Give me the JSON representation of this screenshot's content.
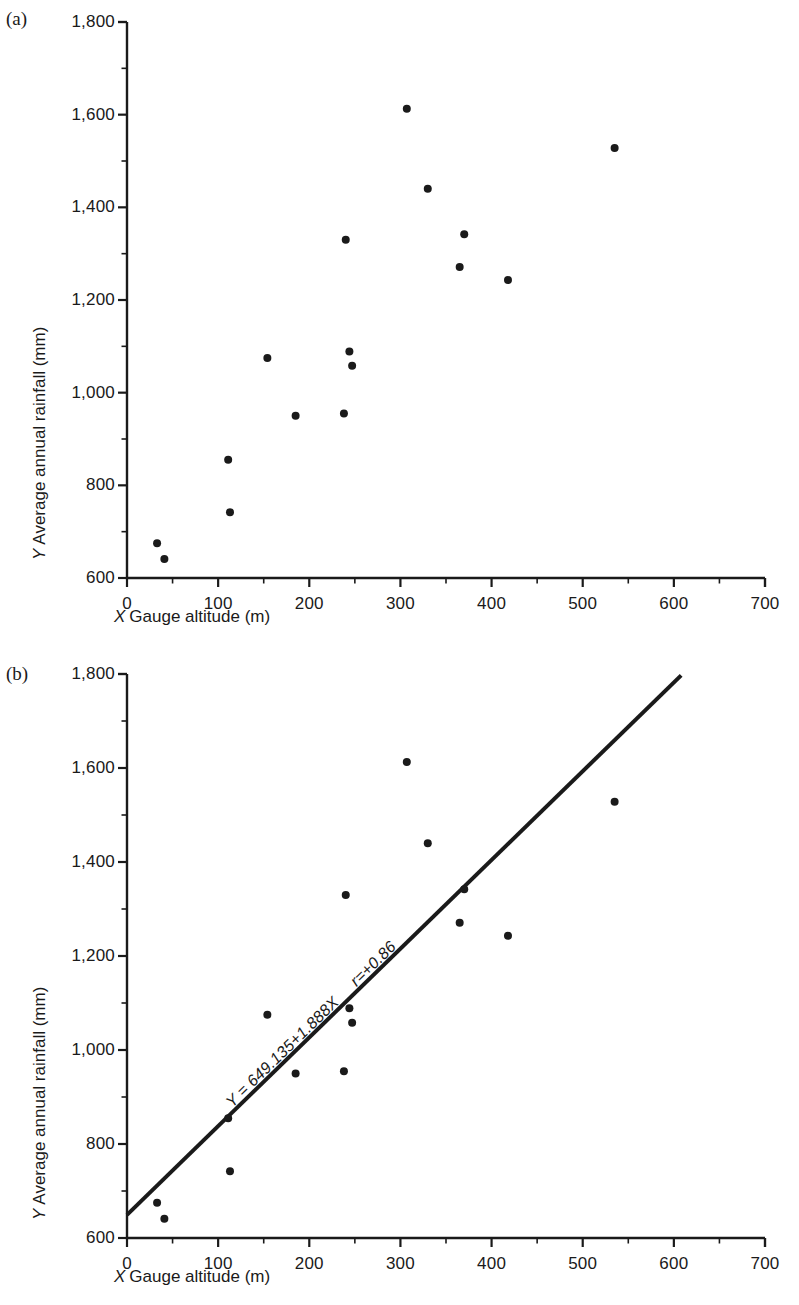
{
  "figure": {
    "panels": [
      {
        "label": "(a)",
        "name": "scatter-plot-without-regression"
      },
      {
        "label": "(b)",
        "name": "scatter-plot-with-regression"
      }
    ]
  },
  "axes": {
    "x_title_var": "X",
    "x_title_text": "Gauge altitude (m)",
    "y_title_var": "Y",
    "y_title_text": "Average annual rainfall (mm)",
    "x_ticks": [
      "0",
      "100",
      "200",
      "300",
      "400",
      "500",
      "600",
      "700"
    ],
    "y_ticks": [
      "600",
      "800",
      "1,000",
      "1,200",
      "1,400",
      "1,600",
      "1,800"
    ]
  },
  "annotation": {
    "equation": "Y = 649.135+1.888X",
    "correlation": "r=+0.86"
  },
  "chart_data": {
    "type": "scatter",
    "title": "",
    "xlabel": "X Gauge altitude (m)",
    "ylabel": "Y Average annual rainfall (mm)",
    "xlim": [
      0,
      700
    ],
    "ylim": [
      600,
      1800
    ],
    "x_tick_values": [
      0,
      100,
      200,
      300,
      400,
      500,
      600,
      700
    ],
    "y_tick_values": [
      600,
      800,
      1000,
      1200,
      1400,
      1600,
      1800
    ],
    "x_minor_tick_step": 50,
    "y_minor_tick_step": 100,
    "grid": false,
    "legend": null,
    "series": [
      {
        "name": "Rain gauge stations",
        "marker": "filled-circle",
        "color": "#1a1a1a",
        "points": [
          {
            "x": 33,
            "y": 675
          },
          {
            "x": 41,
            "y": 641
          },
          {
            "x": 111,
            "y": 855
          },
          {
            "x": 113,
            "y": 742
          },
          {
            "x": 154,
            "y": 1075
          },
          {
            "x": 185,
            "y": 950
          },
          {
            "x": 238,
            "y": 955
          },
          {
            "x": 240,
            "y": 1330
          },
          {
            "x": 244,
            "y": 1089
          },
          {
            "x": 247,
            "y": 1058
          },
          {
            "x": 307,
            "y": 1613
          },
          {
            "x": 330,
            "y": 1440
          },
          {
            "x": 365,
            "y": 1271
          },
          {
            "x": 370,
            "y": 1342
          },
          {
            "x": 418,
            "y": 1243
          },
          {
            "x": 535,
            "y": 1528
          }
        ]
      }
    ],
    "regression": {
      "panel": "(b)",
      "equation": "Y = 649.135 + 1.888X",
      "intercept": 649.135,
      "slope": 1.888,
      "r": 0.86,
      "r_label": "r = +0.86",
      "x_start": 0,
      "x_end": 608
    }
  }
}
